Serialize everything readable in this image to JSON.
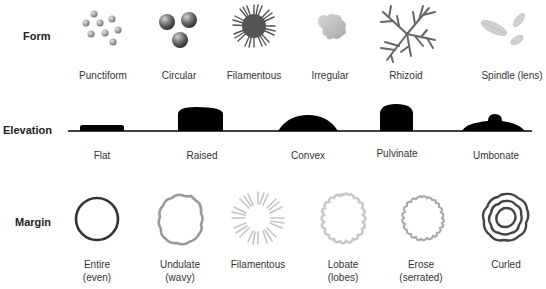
{
  "rows": {
    "form": {
      "label": "Form",
      "items": [
        {
          "name": "Punctiform"
        },
        {
          "name": "Circular"
        },
        {
          "name": "Filamentous"
        },
        {
          "name": "Irregular"
        },
        {
          "name": "Rhizoid"
        },
        {
          "name": "Spindle (lens)"
        }
      ]
    },
    "elevation": {
      "label": "Elevation",
      "items": [
        {
          "name": "Flat"
        },
        {
          "name": "Raised"
        },
        {
          "name": "Convex"
        },
        {
          "name": "Pulvinate"
        },
        {
          "name": "Umbonate"
        }
      ]
    },
    "margin": {
      "label": "Margin",
      "items": [
        {
          "name": "Entire",
          "sub": "(even)"
        },
        {
          "name": "Undulate",
          "sub": "(wavy)"
        },
        {
          "name": "Filamentous",
          "sub": ""
        },
        {
          "name": "Lobate",
          "sub": "(lobes)"
        },
        {
          "name": "Erose",
          "sub": "(serrated)"
        },
        {
          "name": "Curled",
          "sub": ""
        }
      ]
    }
  },
  "colors": {
    "dark": "#333333",
    "mid": "#777777",
    "light": "#bbbbbb",
    "black": "#000000"
  }
}
